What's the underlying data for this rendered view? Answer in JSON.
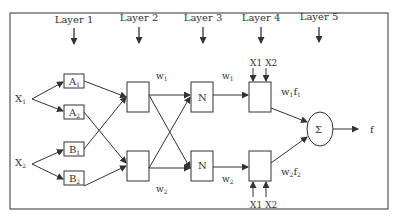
{
  "layers": [
    "Layer 1",
    "Layer 2",
    "Layer 3",
    "Layer 4",
    "Layer 5"
  ],
  "inputs": [
    {
      "name": "X",
      "sub": "1"
    },
    {
      "name": "X",
      "sub": "2"
    }
  ],
  "membership_nodes": [
    {
      "name": "A",
      "sub": "1"
    },
    {
      "name": "A",
      "sub": "2"
    },
    {
      "name": "B",
      "sub": "1"
    },
    {
      "name": "B",
      "sub": "2"
    }
  ],
  "weights": {
    "l2_top": {
      "name": "w",
      "sub": "1"
    },
    "l2_bottom": {
      "name": "w",
      "sub": "2"
    },
    "l3_top": {
      "name": "w",
      "sub": "1"
    },
    "l3_bottom": {
      "name": "w",
      "sub": "2"
    }
  },
  "norm_nodes": [
    "N",
    "N"
  ],
  "layer4_inputs": {
    "top": [
      "X1",
      "X2"
    ],
    "bottom": [
      "X1",
      "X2"
    ]
  },
  "layer4_outputs": [
    {
      "w": "w",
      "wsub": "1",
      "f": "f",
      "fsub": "1"
    },
    {
      "w": "w",
      "wsub": "2",
      "f": "f",
      "fsub": "2"
    }
  ],
  "sum_node": "Σ",
  "output": "f",
  "colors": {
    "stroke": "#333333",
    "background": "#ffffff"
  }
}
